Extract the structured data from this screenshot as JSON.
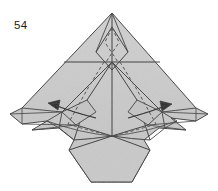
{
  "figure": {
    "kind": "origami-folding-diagram",
    "step_number": "54",
    "background_color": "#ffffff",
    "paper_fill_color": "#c9c9c9",
    "paper_fill_shadow_color": "#bdbdbd",
    "paper_fill_light_color": "#d4d4d4",
    "line_color": "#3a3a3a",
    "crease_color": "#4a4a4a",
    "dashed_crease_color": "#555555",
    "arrow_color": "#222222",
    "arrow_count": 2,
    "arrow_directions": [
      "left",
      "right"
    ]
  },
  "geometry": {
    "outline_points": "112,13 196,108 208,114 196,121 171,118 186,130 159,128 144,140 150,150 132,182 91,182 69,150 74,140 59,128 32,130 47,121 22,124 10,114 22,108",
    "bottom_body_points": "112,135 150,150 132,182 91,182 69,150",
    "apex_diamond_points": "112,27 127,50 112,68 97,50",
    "mid_horizontal_line": "66,62 158,62",
    "center_vertical_line": "112,13 112,137",
    "left_wing_upper": "112,62 62,112 22,108 112,13",
    "right_wing_upper": "112,62 162,112 196,108 112,13",
    "dashed_left": "120,44 60,128",
    "dashed_right": "104,44 164,128",
    "dashed_apex_left": "112,27 104,44",
    "dashed_apex_right": "112,27 120,44",
    "arrow_left_tip": "48,103",
    "arrow_right_tip": "172,105"
  }
}
